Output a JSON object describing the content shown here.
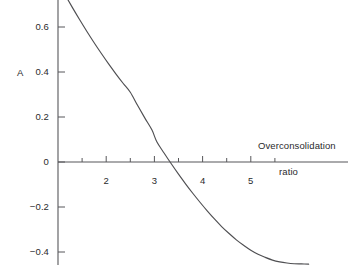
{
  "chart_data": {
    "type": "line",
    "title": "",
    "xlabel": "Overconsolidation ratio",
    "xlabel_line1": "Overconsolidation",
    "xlabel_line2": "ratio",
    "ylabel": "A",
    "xlim": [
      0.8,
      6.4
    ],
    "ylim": [
      -0.52,
      0.86
    ],
    "grid": false,
    "legend": null,
    "x_ticks_major": [
      2,
      3,
      4,
      5
    ],
    "x_tick_labels": [
      "2",
      "3",
      "4",
      "5"
    ],
    "x_ticks_minor": [
      1.5,
      2.5,
      3.5,
      4.5,
      5.5
    ],
    "y_ticks": [
      0.8,
      0.6,
      0.4,
      0.2,
      0,
      -0.2,
      -0.4
    ],
    "y_tick_labels": [
      "0.8",
      "0.6",
      "0.4",
      "0.2",
      "0",
      "−0.2",
      "−0.4"
    ],
    "zero_crossing_x": 3.05,
    "series": [
      {
        "name": "A",
        "x": [
          1.0,
          1.15,
          1.3,
          1.45,
          1.6,
          1.75,
          1.9,
          2.05,
          2.2,
          2.35,
          2.5,
          2.65,
          2.8,
          2.95,
          3.05,
          3.2,
          3.35,
          3.5,
          3.65,
          3.8,
          3.95,
          4.1,
          4.25,
          4.4,
          4.55,
          4.7,
          4.85,
          5.0,
          5.15,
          5.3,
          5.45,
          5.6,
          5.75,
          5.9,
          6.05,
          6.2
        ],
        "y": [
          0.8,
          0.742,
          0.686,
          0.632,
          0.58,
          0.53,
          0.482,
          0.436,
          0.392,
          0.35,
          0.31,
          0.252,
          0.196,
          0.142,
          0.09,
          0.04,
          -0.008,
          -0.054,
          -0.098,
          -0.14,
          -0.18,
          -0.218,
          -0.254,
          -0.288,
          -0.318,
          -0.346,
          -0.37,
          -0.392,
          -0.41,
          -0.424,
          -0.436,
          -0.444,
          -0.449,
          -0.452,
          -0.453,
          -0.454
        ]
      }
    ]
  },
  "axis": {
    "y_label": "A",
    "x_label_line1": "Overconsolidation",
    "x_label_line2": "ratio"
  },
  "colors": {
    "curve": "#4f4f52",
    "axis": "#57575a",
    "text": "#2a2a2c",
    "background": "#ffffff"
  }
}
